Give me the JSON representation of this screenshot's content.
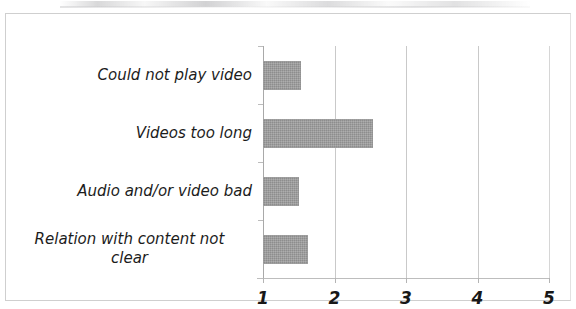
{
  "chart_data": {
    "type": "bar",
    "orientation": "horizontal",
    "title": "",
    "subtitle": "",
    "xlabel": "",
    "ylabel": "",
    "categories": [
      "Could not play video",
      "Videos too long",
      "Audio and/or video bad",
      "Relation with content not\nclear"
    ],
    "values": [
      1.53,
      2.54,
      1.5,
      1.63
    ],
    "xlim": [
      1,
      5
    ],
    "xticks": [
      1,
      2,
      3,
      4,
      5
    ],
    "xtick_labels": [
      "1",
      "2",
      "3",
      "4",
      "5"
    ],
    "grid": "vertical",
    "legend": "none",
    "bar_color": "#9b9b9b",
    "axis_color": "#c9c9c9",
    "frame_color": "#cfcfcf",
    "text_color": "#1c1c1c"
  },
  "figure": {
    "border_visible": true,
    "background": "#ffffff"
  }
}
